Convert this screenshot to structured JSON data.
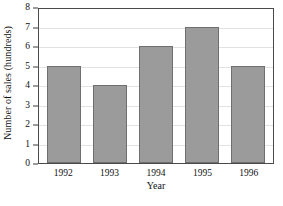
{
  "chart_data": {
    "type": "bar",
    "title": "",
    "categories": [
      "1992",
      "1993",
      "1994",
      "1995",
      "1996"
    ],
    "values": [
      5,
      4,
      6,
      7,
      5
    ],
    "series": [
      {
        "name": "Number of sales",
        "values": [
          5,
          4,
          6,
          7,
          5
        ]
      }
    ],
    "xlabel": "Year",
    "ylabel": "Number of sales (hundreds)",
    "ylim": [
      0,
      8
    ],
    "ytick_labels": [
      "0",
      "1",
      "2",
      "3",
      "4",
      "5",
      "6",
      "7",
      "8"
    ],
    "ytick_values": [
      0,
      1,
      2,
      3,
      4,
      5,
      6,
      7,
      8
    ],
    "grid": "horizontal",
    "legend": "none",
    "colors": {
      "bar_fill": "#9b9b9b",
      "bar_edge": "#6f6f6f",
      "frame": "#4a4a4a",
      "gridline": "#e2e2e2",
      "background": "#ffffff",
      "text": "#111111"
    }
  }
}
